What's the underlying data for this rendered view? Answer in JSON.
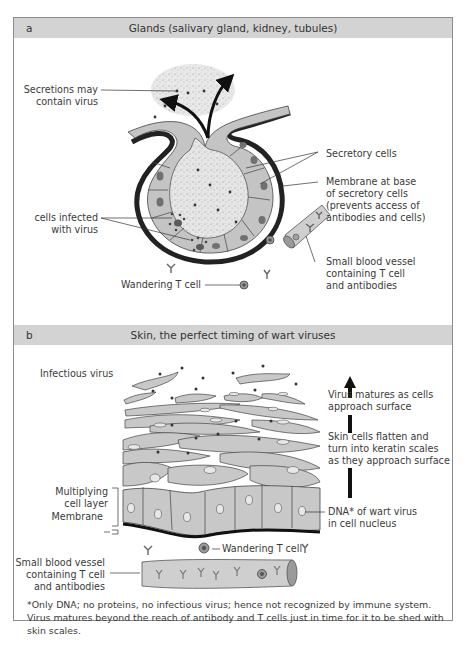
{
  "panel_a": {
    "letter": "a",
    "title": "Glands (salivary gland, kidney, tubules)",
    "labels": {
      "secretions": "Secretions may\ncontain virus",
      "secretory_cells": "Secretory cells",
      "membrane": "Membrane at base\nof secretory cells\n(prevents access of\nantibodies and cells)",
      "infected_cells": "cells infected\nwith virus",
      "blood_vessel": "Small blood vessel\ncontaining T cell\nand antibodies",
      "wandering_t_cell": "Wandering T cell"
    }
  },
  "panel_b": {
    "letter": "b",
    "title": "Skin, the perfect timing of wart viruses",
    "labels": {
      "infectious_virus": "Infectious virus",
      "virus_matures": "Virus matures as cells\napproach surface",
      "skin_flatten": "Skin cells flatten and\nturn into keratin scales\nas they approach surface",
      "multiplying_layer": "Multiplying\ncell layer",
      "membrane": "Membrane",
      "dna": "DNA* of wart virus\nin cell nucleus",
      "wandering_t_cell": "Wandering T cell",
      "blood_vessel": "Small blood vessel\ncontaining T cell\nand antibodies"
    }
  },
  "footnote": "*Only DNA; no proteins, no infectious virus; hence not recognized by immune system. Virus matures beyond the reach of antibody and T cells just in time for it to be shed with skin scales.",
  "colors": {
    "header_bg": "#d3d3d3",
    "cell_fill": "#c8c8c8",
    "membrane": "#2a2a2a",
    "nucleus": "#707070"
  }
}
